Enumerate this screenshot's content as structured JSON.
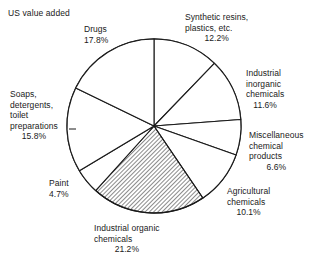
{
  "chart_data": {
    "type": "pie",
    "title": "US value added",
    "xlabel": "",
    "ylabel": "",
    "units": "percent",
    "start_angle_deg": 0,
    "direction": "clockwise",
    "legend": "none (direct labels)",
    "grid": false,
    "categories": [
      "Synthetic resins, plastics, etc.",
      "Industrial inorganic chemicals",
      "Miscellaneous chemical products",
      "Agricultural chemicals",
      "Industrial organic chemicals",
      "Paint",
      "Soaps, detergents, toilet preparations",
      "Drugs"
    ],
    "values": [
      12.2,
      11.6,
      6.6,
      10.1,
      21.2,
      4.7,
      15.8,
      17.8
    ],
    "slices": [
      {
        "key": "synthetic_resins",
        "name_lines": [
          "Synthetic resins,",
          "plastics, etc."
        ],
        "value": 12.2,
        "value_label": "12.2%",
        "hatched": false
      },
      {
        "key": "industrial_inorganic",
        "name_lines": [
          "Industrial",
          "inorganic",
          "chemicals"
        ],
        "value": 11.6,
        "value_label": "11.6%",
        "hatched": false
      },
      {
        "key": "miscellaneous",
        "name_lines": [
          "Miscellaneous",
          "chemical",
          "products"
        ],
        "value": 6.6,
        "value_label": "6.6%",
        "hatched": false
      },
      {
        "key": "agricultural",
        "name_lines": [
          "Agricultural",
          "chemicals"
        ],
        "value": 10.1,
        "value_label": "10.1%",
        "hatched": false
      },
      {
        "key": "industrial_organic",
        "name_lines": [
          "Industrial organic",
          "chemicals"
        ],
        "value": 21.2,
        "value_label": "21.2%",
        "hatched": true
      },
      {
        "key": "paint",
        "name_lines": [
          "Paint"
        ],
        "value": 4.7,
        "value_label": "4.7%",
        "hatched": false
      },
      {
        "key": "soaps",
        "name_lines": [
          "Soaps,",
          "detergents,",
          "toilet",
          "preparations"
        ],
        "value": 15.8,
        "value_label": "15.8%",
        "hatched": false
      },
      {
        "key": "drugs",
        "name_lines": [
          "Drugs"
        ],
        "value": 17.8,
        "value_label": "17.8%",
        "hatched": false
      }
    ],
    "colors": {
      "background": "#ffffff",
      "outline": "#1a1a1a",
      "slice_fill": "#ffffff",
      "hatch": "#333333",
      "text": "#1a1a1a"
    }
  },
  "labels": {
    "drugs": {
      "l1": "Drugs",
      "pct": "17.8%"
    },
    "synthetic": {
      "l1": "Synthetic resins,",
      "l2": "plastics, etc.",
      "pct": "12.2%"
    },
    "inorganic": {
      "l1": "Industrial",
      "l2": "inorganic",
      "l3": "chemicals",
      "pct": "11.6%"
    },
    "miscellaneous": {
      "l1": "Miscellaneous",
      "l2": "chemical",
      "l3": "products",
      "pct": "6.6%"
    },
    "agricultural": {
      "l1": "Agricultural",
      "l2": "chemicals",
      "pct": "10.1%"
    },
    "industrial_organic": {
      "l1": "Industrial organic",
      "l2": "chemicals",
      "pct": "21.2%"
    },
    "paint": {
      "l1": "Paint",
      "pct": "4.7%"
    },
    "soaps": {
      "l1": "Soaps,",
      "l2": "detergents,",
      "l3": "toilet",
      "l4": "preparations",
      "pct": "15.8%"
    }
  }
}
